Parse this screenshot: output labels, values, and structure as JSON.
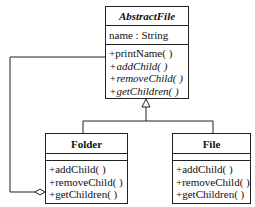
{
  "diagram": {
    "type": "UML class diagram (Composite pattern)",
    "classes": [
      {
        "id": "abstract_file",
        "name": "AbstractFile",
        "abstract": true,
        "attributes": [
          "name : String"
        ],
        "operations": [
          {
            "label": "+printName( )",
            "abstract": false
          },
          {
            "label": "+addChild( )",
            "abstract": true
          },
          {
            "label": "+removeChild( )",
            "abstract": true
          },
          {
            "label": "+getChildren( )",
            "abstract": true
          }
        ]
      },
      {
        "id": "folder",
        "name": "Folder",
        "attributes": [],
        "operations": [
          {
            "label": "+addChild( )"
          },
          {
            "label": "+removeChild( )"
          },
          {
            "label": "+getChildren( )"
          }
        ]
      },
      {
        "id": "file",
        "name": "File",
        "attributes": [],
        "operations": [
          {
            "label": "+addChild( )"
          },
          {
            "label": "+removeChild( )"
          },
          {
            "label": "+getChildren( )"
          }
        ]
      }
    ],
    "relationships": [
      {
        "type": "generalization",
        "from": "Folder",
        "to": "AbstractFile"
      },
      {
        "type": "generalization",
        "from": "File",
        "to": "AbstractFile"
      },
      {
        "type": "aggregation",
        "from": "Folder",
        "to": "AbstractFile"
      }
    ]
  }
}
